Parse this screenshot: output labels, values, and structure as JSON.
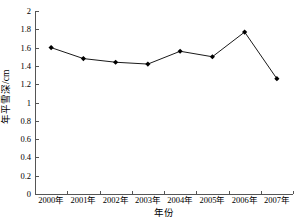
{
  "chart_data": {
    "type": "line",
    "title": "",
    "subtitle": "",
    "xlabel": "年份",
    "ylabel": "年平雪深/cm",
    "categories": [
      "2000年",
      "2001年",
      "2002年",
      "2003年",
      "2004年",
      "2005年",
      "2006年",
      "2007年"
    ],
    "values": [
      1.6,
      1.48,
      1.44,
      1.42,
      1.56,
      1.5,
      1.77,
      1.26
    ],
    "series": [
      {
        "name": "年平雪深",
        "values": [
          1.6,
          1.48,
          1.44,
          1.42,
          1.56,
          1.5,
          1.77,
          1.26
        ]
      }
    ],
    "ylim": [
      0,
      2
    ],
    "ytick_labels": [
      "0",
      "0.2",
      "0.4",
      "0.6",
      "0.8",
      "1",
      "1.2",
      "1.4",
      "1.6",
      "1.8",
      "2"
    ],
    "ytick_values": [
      0,
      0.2,
      0.4,
      0.6,
      0.8,
      1,
      1.2,
      1.4,
      1.6,
      1.8,
      2
    ],
    "grid": false,
    "legend": false,
    "legend_position": "none",
    "line_color": "#1a1a1a",
    "marker_color": "#000000",
    "marker_shape": "diamond",
    "axis_color": "#555555",
    "background_color": "#ffffff"
  }
}
